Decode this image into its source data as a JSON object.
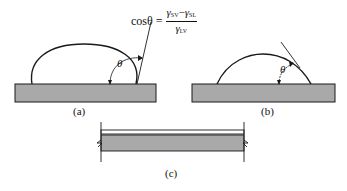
{
  "formula": {
    "lhs": "cosθ =",
    "numerator": {
      "g1": "γ",
      "s1": "SV",
      "minus": "−",
      "g2": "γ",
      "s2": "SL"
    },
    "denominator": {
      "g": "γ",
      "s": "LV"
    }
  },
  "panels": [
    {
      "id": "a",
      "label": "(a)",
      "angle_symbol": "θ",
      "description": "Sessile drop with contact angle greater than 90 degrees on substrate"
    },
    {
      "id": "b",
      "label": "(b)",
      "angle_symbol": "θ",
      "description": "Sessile drop with contact angle less than 90 degrees on substrate"
    },
    {
      "id": "c",
      "label": "(c)",
      "description": "Complete wetting: thin liquid film spread over substrate (cut section)"
    }
  ],
  "colors": {
    "substrate": "#a9a9a9",
    "outline": "#1a1a1a",
    "background": "#ffffff"
  }
}
